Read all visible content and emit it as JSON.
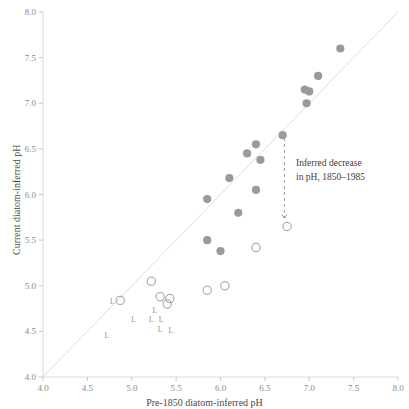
{
  "chart_data": {
    "type": "scatter",
    "title": "",
    "xlabel": "Pre-1850 diatom-inferred pH",
    "ylabel": "Current diatom-inferred pH",
    "xlim": [
      4.0,
      8.0
    ],
    "ylim": [
      4.0,
      8.0
    ],
    "xticks": [
      "4.0",
      "4.5",
      "5.0",
      "5.5",
      "6.0",
      "6.5",
      "7.0",
      "7.5",
      "8.0"
    ],
    "yticks": [
      "4.0",
      "4.5",
      "5.0",
      "5.5",
      "6.0",
      "6.5",
      "7.0",
      "7.5",
      "8.0"
    ],
    "grid": false,
    "legend": "none",
    "reference_line": {
      "name": "one-to-one-line",
      "from": [
        4.0,
        4.0
      ],
      "to": [
        8.0,
        8.0
      ],
      "color": "#dcdcdc"
    },
    "marker_color": "#9a9a9a",
    "series": [
      {
        "name": "filled-circles",
        "marker": "filled-circle",
        "points": [
          [
            7.35,
            7.6
          ],
          [
            7.1,
            7.3
          ],
          [
            6.95,
            7.15
          ],
          [
            7.0,
            7.13
          ],
          [
            6.97,
            7.0
          ],
          [
            6.7,
            6.65
          ],
          [
            6.4,
            6.55
          ],
          [
            6.3,
            6.45
          ],
          [
            6.45,
            6.38
          ],
          [
            6.1,
            6.18
          ],
          [
            6.4,
            6.05
          ],
          [
            5.85,
            5.95
          ],
          [
            6.2,
            5.8
          ],
          [
            5.85,
            5.5
          ],
          [
            6.0,
            5.38
          ]
        ]
      },
      {
        "name": "open-circles",
        "marker": "open-circle",
        "points": [
          [
            6.75,
            5.65
          ],
          [
            6.4,
            5.42
          ],
          [
            6.05,
            5.0
          ],
          [
            5.85,
            4.95
          ],
          [
            5.22,
            5.05
          ],
          [
            5.32,
            4.88
          ],
          [
            5.43,
            4.86
          ],
          [
            5.4,
            4.8
          ],
          [
            4.87,
            4.84
          ]
        ]
      },
      {
        "name": "l-labelled-points",
        "marker": "letter-L",
        "label": "L",
        "points": [
          [
            4.78,
            4.82
          ],
          [
            4.72,
            4.45
          ],
          [
            5.02,
            4.63
          ],
          [
            5.26,
            4.72
          ],
          [
            5.22,
            4.63
          ],
          [
            5.33,
            4.62
          ],
          [
            5.32,
            4.52
          ],
          [
            5.44,
            4.5
          ]
        ]
      }
    ],
    "annotations": [
      {
        "name": "inferred-decrease-annotation",
        "text_lines": [
          "Inferred decrease",
          "in pH, 1850–1985"
        ],
        "arrow": {
          "style": "dashed",
          "from": [
            6.72,
            6.62
          ],
          "to": [
            6.72,
            5.74
          ],
          "color": "#9a9a9a"
        }
      }
    ]
  }
}
